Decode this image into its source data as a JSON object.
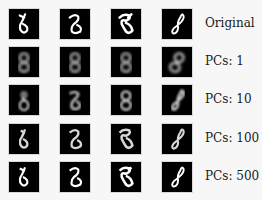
{
  "figure": {
    "columns": 4,
    "rows": [
      {
        "label": "Original",
        "blur": 0,
        "glow": 1.0
      },
      {
        "label": "PCs: 1",
        "blur": 2.2,
        "glow": 0.75
      },
      {
        "label": "PCs: 10",
        "blur": 1.4,
        "glow": 0.85
      },
      {
        "label": "PCs: 100",
        "blur": 0.8,
        "glow": 0.9
      },
      {
        "label": "PCs: 500",
        "blur": 0.3,
        "glow": 1.0
      }
    ],
    "digits": [
      "8",
      "8",
      "8",
      "8"
    ],
    "colors": {
      "background": "#f7f7f7",
      "tile": "#000000",
      "stroke": "#ffffff",
      "text": "#1a1a1a"
    }
  }
}
